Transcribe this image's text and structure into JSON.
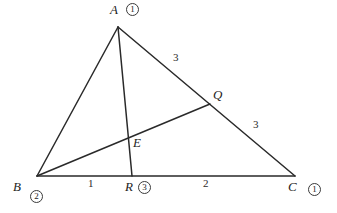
{
  "figure": {
    "type": "geometry-diagram",
    "width": 337,
    "height": 213,
    "stroke_color": "#2a2a2a",
    "background_color": "#ffffff"
  },
  "points": {
    "A": {
      "label": "A",
      "x": 118,
      "y": 27,
      "mass": "1"
    },
    "B": {
      "label": "B",
      "x": 37,
      "y": 176,
      "mass": "2"
    },
    "C": {
      "label": "C",
      "x": 295,
      "y": 176,
      "mass": "1"
    },
    "Q": {
      "label": "Q",
      "x": 210,
      "y": 104,
      "mass": ""
    },
    "R": {
      "label": "R",
      "x": 132,
      "y": 176,
      "mass": "3"
    },
    "E": {
      "label": "E",
      "x": 129,
      "y": 134,
      "mass": ""
    }
  },
  "vertex_labels": [
    {
      "name": "label-A",
      "text": "A",
      "x": 110,
      "y": 3
    },
    {
      "name": "label-B",
      "text": "B",
      "x": 13,
      "y": 180
    },
    {
      "name": "label-C",
      "text": "C",
      "x": 288,
      "y": 180
    },
    {
      "name": "label-Q",
      "text": "Q",
      "x": 213,
      "y": 88
    },
    {
      "name": "label-R",
      "text": "R",
      "x": 125,
      "y": 180
    },
    {
      "name": "label-E",
      "text": "E",
      "x": 133,
      "y": 136
    }
  ],
  "mass_markers": [
    {
      "name": "mass-A",
      "text": "1",
      "x": 126,
      "y": 3
    },
    {
      "name": "mass-B",
      "text": "2",
      "x": 30,
      "y": 190
    },
    {
      "name": "mass-C",
      "text": "1",
      "x": 308,
      "y": 183
    },
    {
      "name": "mass-R",
      "text": "3",
      "x": 138,
      "y": 181
    }
  ],
  "segment_labels": [
    {
      "name": "segment-length-AQ",
      "text": "3",
      "x": 173,
      "y": 52
    },
    {
      "name": "segment-length-QC",
      "text": "3",
      "x": 253,
      "y": 119
    },
    {
      "name": "segment-length-BR",
      "text": "1",
      "x": 88,
      "y": 178
    },
    {
      "name": "segment-length-RC",
      "text": "2",
      "x": 203,
      "y": 178
    }
  ],
  "segments": [
    {
      "name": "side-AB",
      "from": "A",
      "to": "B"
    },
    {
      "name": "side-AC",
      "from": "A",
      "to": "C"
    },
    {
      "name": "side-BC",
      "from": "B",
      "to": "C"
    },
    {
      "name": "cevian-AR",
      "from": "A",
      "to": "R"
    },
    {
      "name": "cevian-BQ",
      "from": "B",
      "to": "Q"
    }
  ]
}
